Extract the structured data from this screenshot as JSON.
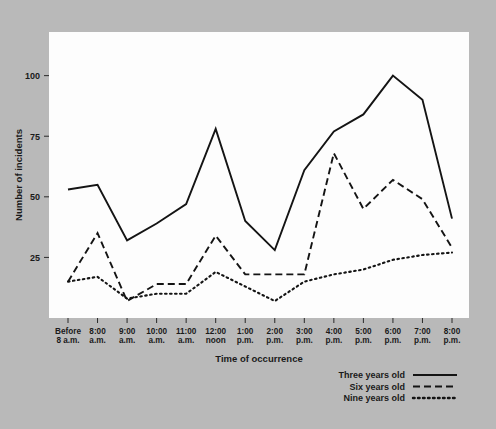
{
  "chart_data": {
    "type": "line",
    "title": "",
    "xlabel": "Time of occurrence",
    "ylabel": "Number of incidents",
    "categories": [
      "Before\n8 a.m.",
      "8:00\na.m.",
      "9:00\na.m.",
      "10:00\na.m.",
      "11:00\na.m.",
      "12:00\nnoon",
      "1:00\np.m.",
      "2:00\np.m.",
      "3:00\np.m.",
      "4:00\np.m.",
      "5:00\np.m.",
      "6:00\np.m.",
      "7:00\np.m.",
      "8:00\np.m."
    ],
    "categories_line1": [
      "Before",
      "8:00",
      "9:00",
      "10:00",
      "11:00",
      "12:00",
      "1:00",
      "2:00",
      "3:00",
      "4:00",
      "5:00",
      "6:00",
      "7:00",
      "8:00"
    ],
    "categories_line2": [
      "8 a.m.",
      "a.m.",
      "a.m.",
      "a.m.",
      "a.m.",
      "noon",
      "p.m.",
      "p.m.",
      "p.m.",
      "p.m.",
      "p.m.",
      "p.m.",
      "p.m.",
      "p.m."
    ],
    "series": [
      {
        "name": "Three years old",
        "style": "solid",
        "values": [
          53,
          55,
          32,
          39,
          47,
          78,
          40,
          28,
          61,
          77,
          84,
          100,
          90,
          41
        ]
      },
      {
        "name": "Six years old",
        "style": "dashed",
        "values": [
          15,
          35,
          7,
          14,
          14,
          34,
          18,
          18,
          18,
          68,
          45,
          57,
          49,
          29
        ]
      },
      {
        "name": "Nine years old",
        "style": "dotted",
        "values": [
          15,
          17,
          8,
          10,
          10,
          19,
          13,
          7,
          15,
          18,
          20,
          24,
          26,
          27
        ]
      }
    ],
    "yticks": [
      25,
      50,
      75,
      100
    ],
    "ylim": [
      0,
      118
    ],
    "grid": false,
    "legend_position": "below-right"
  },
  "legend": {
    "entries": [
      {
        "label": "Three years old",
        "style": "solid"
      },
      {
        "label": "Six years old",
        "style": "dashed"
      },
      {
        "label": "Nine years old",
        "style": "dotted"
      }
    ]
  },
  "colors": {
    "background": "#b9b9b9",
    "plot_background": "#fdfdfd",
    "line": "#141414",
    "text": "#1a1a1a"
  }
}
